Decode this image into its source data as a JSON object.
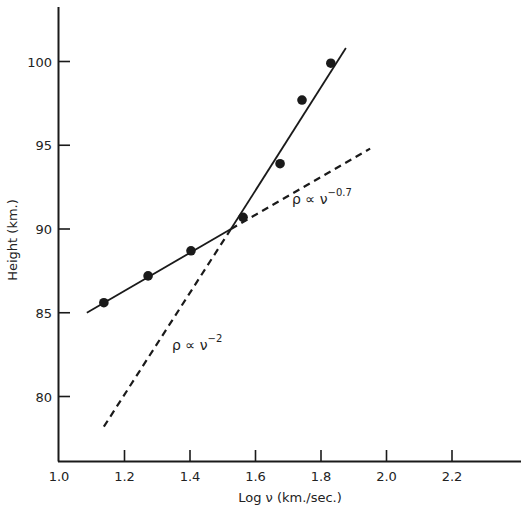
{
  "chart_data": {
    "type": "scatter",
    "title": "",
    "xlabel": "Log ν (km./sec.)",
    "ylabel": "Height (km.)",
    "xlim": [
      1.0,
      2.4
    ],
    "ylim": [
      76,
      104
    ],
    "grid": false,
    "legend": null,
    "x_ticks": [
      1.0,
      1.2,
      1.4,
      1.6,
      1.8,
      2.0,
      2.2
    ],
    "x_tick_labels": [
      "1.0",
      "1.2",
      "1.4",
      "1.6",
      "1.8",
      "2.0",
      "2.2"
    ],
    "y_ticks": [
      80,
      85,
      90,
      95,
      100
    ],
    "y_tick_labels": [
      "80",
      "85",
      "90",
      "95",
      "100"
    ],
    "series": [
      {
        "name": "observed",
        "kind": "points",
        "x": [
          1.137,
          1.272,
          1.403,
          1.562,
          1.675,
          1.742,
          1.83
        ],
        "y": [
          85.6,
          87.2,
          88.7,
          90.7,
          93.9,
          97.7,
          99.9
        ]
      },
      {
        "name": "fit-lower",
        "kind": "line",
        "style": "solid",
        "x": [
          1.085,
          1.525
        ],
        "y": [
          85.0,
          90.0
        ]
      },
      {
        "name": "fit-upper",
        "kind": "line",
        "style": "solid",
        "x": [
          1.525,
          1.876
        ],
        "y": [
          90.0,
          100.8
        ]
      },
      {
        "name": "ρ ∝ ν^-0.7",
        "kind": "line",
        "style": "dashed",
        "x": [
          1.525,
          1.95
        ],
        "y": [
          90.0,
          94.8
        ]
      },
      {
        "name": "ρ ∝ ν^-2",
        "kind": "line",
        "style": "dashed",
        "x": [
          1.137,
          1.525
        ],
        "y": [
          78.2,
          90.0
        ]
      }
    ],
    "annotations": [
      {
        "text": "ρ ∝ ν",
        "sup": "−0.7",
        "x": 1.72,
        "y": 91.8
      },
      {
        "text": "ρ ∝ ν",
        "sup": "−2",
        "x": 1.345,
        "y": 82.7
      }
    ]
  },
  "labels": {
    "xlabel": "Log ν (km./sec.)",
    "ylabel": "Height (km.)",
    "annot_upper_base": "ρ ∝ ν",
    "annot_upper_sup": "−0.7",
    "annot_lower_base": "ρ ∝ ν",
    "annot_lower_sup": "−2"
  },
  "style": {
    "ink": "#1a1a1a",
    "background": "#ffffff"
  }
}
